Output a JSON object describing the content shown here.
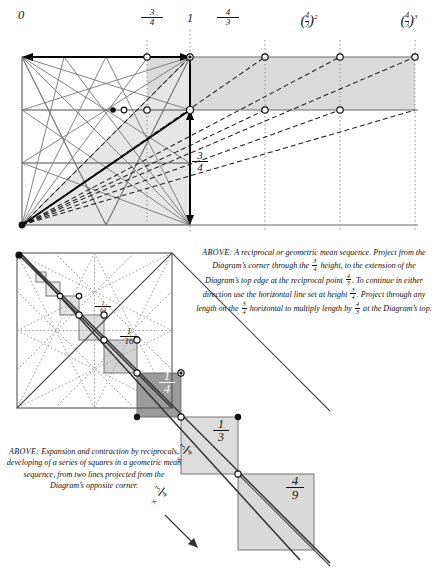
{
  "figure": {
    "background": "#ffffff",
    "ink": "#1a1a1a"
  },
  "top_diagram": {
    "axis_labels": [
      {
        "id": "zero",
        "text": "0",
        "kind": "plain",
        "x": 20,
        "y": 20
      },
      {
        "id": "three-quarters",
        "kind": "fraction",
        "numerator": "3",
        "denominator": "4",
        "x": 152,
        "y": 14
      },
      {
        "id": "one",
        "text": "1",
        "kind": "plain",
        "x": 189,
        "y": 20
      },
      {
        "id": "four-thirds",
        "kind": "fraction",
        "numerator": "4",
        "denominator": "3",
        "x": 228,
        "y": 14
      },
      {
        "id": "four-thirds-squared",
        "kind": "power",
        "numerator": "4",
        "denominator": "3",
        "exponent": "2",
        "x": 303,
        "y": 16
      },
      {
        "id": "four-thirds-cubed",
        "kind": "power",
        "numerator": "4",
        "denominator": "3",
        "exponent": "3",
        "x": 403,
        "y": 16
      }
    ],
    "height_label": {
      "numerator": "3",
      "denominator": "4"
    },
    "tick_values": [
      "0",
      "3/4",
      "1",
      "4/3",
      "(4/3)^2",
      "(4/3)^3"
    ],
    "styles": {
      "shade": "#d8d8d8",
      "construction_line": "#6f6f6f",
      "dashed_line": "#2b2b2b",
      "heavy_line": "#000000",
      "dotted_guide": "#8a8a8a"
    }
  },
  "bottom_diagram": {
    "square_labels": [
      {
        "id": "one-sixty-fourth",
        "numerator": "1",
        "denominator": "64",
        "size": 6.0,
        "x": 100,
        "y": 305
      },
      {
        "id": "one-sixteenth",
        "numerator": "1",
        "denominator": "16",
        "size": 8.5,
        "x": 128,
        "y": 333
      },
      {
        "id": "one-quarter",
        "numerator": "1",
        "denominator": "4",
        "size": 11.5,
        "x": 166,
        "y": 376
      },
      {
        "id": "one-third",
        "numerator": "1",
        "denominator": "3",
        "size": 11.5,
        "x": 221,
        "y": 424
      },
      {
        "id": "four-ninths",
        "numerator": "4",
        "denominator": "9",
        "size": 13.0,
        "x": 294,
        "y": 481
      }
    ],
    "multiplier_notes": [
      {
        "id": "multiplier-upper",
        "symbol": "×",
        "numerator": "3",
        "denominator": "4",
        "x": 181,
        "y": 452
      },
      {
        "id": "multiplier-lower",
        "symbol": "×",
        "numerator": "3",
        "denominator": "4",
        "x": 156,
        "y": 494
      }
    ],
    "styles": {
      "shade_light": "#e2e2e2",
      "shade_mid": "#cfcfcf",
      "shade_dark": "#9a9a9a",
      "dotted": "#9b9b9b",
      "solid": "#3a3a3a"
    }
  },
  "caption_right": {
    "lead": "ABOVE:",
    "segments": [
      {
        "t": "text",
        "v": " A reciprocal or geometric mean sequence.  Project from the Diagram’s corner through the "
      },
      {
        "t": "frac",
        "n": "3",
        "d": "4"
      },
      {
        "t": "text",
        "v": " height, to the extension of the Diagram’s top edge at the reciprocal point "
      },
      {
        "t": "frac",
        "n": "4",
        "d": "3"
      },
      {
        "t": "text",
        "v": ".  To continue in either direction use the horizontal line set at height "
      },
      {
        "t": "frac",
        "n": "3",
        "d": "4"
      },
      {
        "t": "text",
        "v": ".  Project through any length on the "
      },
      {
        "t": "frac",
        "n": "3",
        "d": "4"
      },
      {
        "t": "text",
        "v": " horizontal to multiply length by "
      },
      {
        "t": "frac",
        "n": "4",
        "d": "3"
      },
      {
        "t": "text",
        "v": " at the Diagram’s top."
      }
    ],
    "plain_text": "ABOVE: A reciprocal or geometric mean sequence. Project from the Diagram's corner through the 3/4 height, to the extension of the Diagram's top edge at the reciprocal point 4/3. To continue in either direction use the horizontal line set at height 3/4. Project through any length on the 3/4 horizontal to multiply length by 4/3 at the Diagram's top."
  },
  "caption_left": {
    "lead": "ABOVE:",
    "text": " Expansion and contraction by reciprocals, developing of a series of squares in a geometric mean sequence, from two lines projected from the Diagram’s opposite corner."
  }
}
